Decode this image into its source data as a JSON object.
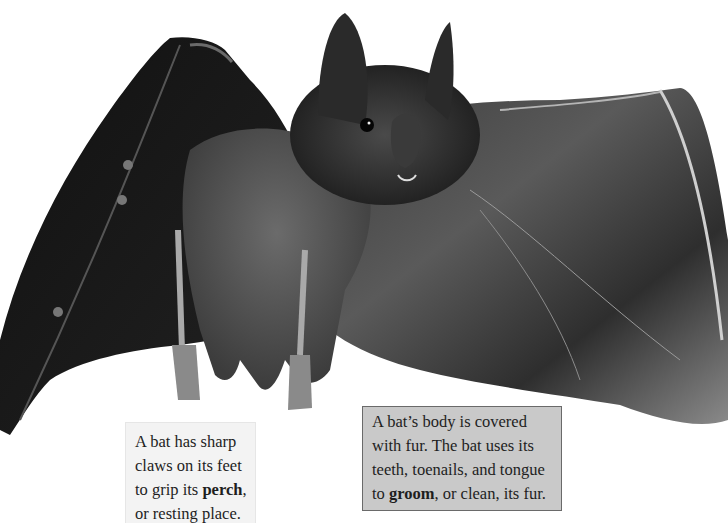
{
  "figure": {
    "style": "grayscale photograph",
    "background_color": "#ffffff"
  },
  "captions": [
    {
      "id": "claws",
      "lines": [
        {
          "text": "A bat has sharp"
        },
        {
          "text": "claws on its feet"
        },
        {
          "before": "to grip its ",
          "bold": "perch",
          "after": ","
        },
        {
          "text": "or resting place."
        }
      ],
      "background": "#f3f3f3"
    },
    {
      "id": "grooming",
      "lines": [
        {
          "text": "A bat’s body is covered"
        },
        {
          "text": "with fur. The bat uses its"
        },
        {
          "text": "teeth, toenails, and tongue"
        },
        {
          "before": "to ",
          "bold": "groom",
          "after": ", or clean, its fur."
        }
      ],
      "background": "#c9c9c9",
      "border": "#6a6a6a"
    }
  ]
}
